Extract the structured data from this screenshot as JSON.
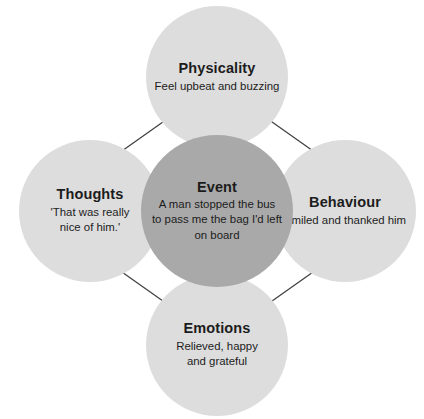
{
  "diagram": {
    "type": "five-areas-cbt-hot-cross-bun",
    "colors": {
      "center_fill": "#a9a9a9",
      "outer_fill": "#dddddd",
      "text": "#1c1c1c",
      "arrow": "#404040",
      "background": "#ffffff"
    },
    "center": {
      "id": "event",
      "title": "Event",
      "description": "A man stopped the bus to pass me the bag I'd left on board",
      "description_lines": [
        "A man stopped the bus",
        "to pass me the bag I'd left",
        "on board"
      ]
    },
    "nodes": [
      {
        "id": "physicality",
        "title": "Physicality",
        "description": "Feel upbeat and buzzing",
        "description_lines": [
          "Feel upbeat and buzzing"
        ],
        "position": "top"
      },
      {
        "id": "thoughts",
        "title": "Thoughts",
        "description": "'That was really nice of him.'",
        "description_lines": [
          "'That was really",
          "nice of him.'"
        ],
        "position": "left"
      },
      {
        "id": "behaviour",
        "title": "Behaviour",
        "description": "Smiled and thanked him",
        "description_lines": [
          "Smiled and thanked him"
        ],
        "position": "right"
      },
      {
        "id": "emotions",
        "title": "Emotions",
        "description": "Relieved, happy and grateful",
        "description_lines": [
          "Relieved, happy",
          "and grateful"
        ],
        "position": "bottom"
      }
    ],
    "connectors": [
      {
        "id": "event-physicality",
        "from": "event",
        "to": "physicality",
        "style": "double-headed",
        "orientation": "vertical"
      },
      {
        "id": "event-emotions",
        "from": "event",
        "to": "emotions",
        "style": "double-headed",
        "orientation": "vertical"
      },
      {
        "id": "event-thoughts",
        "from": "event",
        "to": "thoughts",
        "style": "double-headed",
        "orientation": "horizontal"
      },
      {
        "id": "event-behaviour",
        "from": "event",
        "to": "behaviour",
        "style": "double-headed",
        "orientation": "horizontal"
      },
      {
        "id": "thoughts-physicality",
        "from": "thoughts",
        "to": "physicality",
        "style": "double-headed",
        "orientation": "diagonal"
      },
      {
        "id": "physicality-behaviour",
        "from": "physicality",
        "to": "behaviour",
        "style": "double-headed",
        "orientation": "diagonal"
      },
      {
        "id": "thoughts-emotions",
        "from": "thoughts",
        "to": "emotions",
        "style": "double-headed",
        "orientation": "diagonal"
      },
      {
        "id": "emotions-behaviour",
        "from": "emotions",
        "to": "behaviour",
        "style": "double-headed",
        "orientation": "diagonal"
      }
    ]
  }
}
